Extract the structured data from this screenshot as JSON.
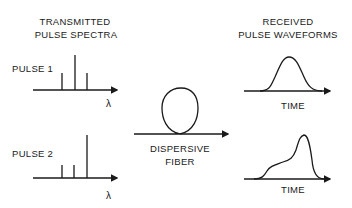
{
  "left": {
    "title_line1": "TRANSMITTED",
    "title_line2": "PULSE SPECTRA",
    "pulse1_label": "PULSE 1",
    "pulse2_label": "PULSE 2",
    "axis_label": "λ"
  },
  "middle": {
    "fiber_line1": "DISPERSIVE",
    "fiber_line2": "FIBER"
  },
  "right": {
    "title_line1": "RECEIVED",
    "title_line2": "PULSE WAVEFORMS",
    "axis_label": "TIME"
  },
  "colors": {
    "ink": "#1a1a1a",
    "background": "#ffffff"
  }
}
